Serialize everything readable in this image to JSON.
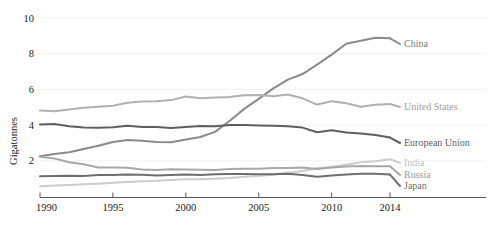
{
  "chart_data": {
    "type": "line",
    "title": "",
    "xlabel": "",
    "ylabel": "Gigatonnes",
    "xlim": [
      1990,
      2014
    ],
    "ylim": [
      0,
      10.6
    ],
    "grid": true,
    "legend_position": "right-inline",
    "xticks": [
      "1990",
      "1995",
      "2000",
      "2005",
      "2010",
      "2014"
    ],
    "xtick_values": [
      1990,
      1995,
      2000,
      2005,
      2010,
      2014
    ],
    "yticks": [
      "2",
      "4",
      "6",
      "8",
      "10"
    ],
    "ytick_values": [
      2,
      4,
      6,
      8,
      10
    ],
    "x": [
      1990,
      1991,
      1992,
      1993,
      1994,
      1995,
      1996,
      1997,
      1998,
      1999,
      2000,
      2001,
      2002,
      2003,
      2004,
      2005,
      2006,
      2007,
      2008,
      2009,
      2010,
      2011,
      2012,
      2013,
      2014
    ],
    "series": [
      {
        "name": "China",
        "label": "China",
        "color": "#8a8a8a",
        "label_color": "#7a7a7a",
        "values": [
          2.25,
          2.38,
          2.48,
          2.66,
          2.84,
          3.05,
          3.16,
          3.12,
          3.06,
          3.04,
          3.19,
          3.33,
          3.62,
          4.23,
          4.91,
          5.47,
          6.06,
          6.55,
          6.86,
          7.39,
          7.95,
          8.56,
          8.72,
          8.89,
          8.86
        ]
      },
      {
        "name": "United States",
        "label": "United States",
        "color": "#b0b0b0",
        "label_color": "#a0a0a0",
        "values": [
          4.82,
          4.77,
          4.87,
          4.97,
          5.03,
          5.08,
          5.25,
          5.32,
          5.34,
          5.4,
          5.6,
          5.51,
          5.54,
          5.58,
          5.67,
          5.69,
          5.61,
          5.71,
          5.5,
          5.15,
          5.34,
          5.22,
          5.03,
          5.14,
          5.18
        ]
      },
      {
        "name": "European Union",
        "label": "European Union",
        "color": "#5f5f5f",
        "label_color": "#5f5f5f",
        "values": [
          4.03,
          4.06,
          3.94,
          3.87,
          3.85,
          3.88,
          3.96,
          3.89,
          3.89,
          3.84,
          3.89,
          3.95,
          3.94,
          4.0,
          4.0,
          3.98,
          3.97,
          3.93,
          3.86,
          3.6,
          3.71,
          3.58,
          3.53,
          3.44,
          3.3
        ]
      },
      {
        "name": "India",
        "label": "India",
        "color": "#cccccc",
        "label_color": "#c0c0c0",
        "values": [
          0.58,
          0.62,
          0.65,
          0.68,
          0.72,
          0.77,
          0.81,
          0.85,
          0.88,
          0.93,
          0.96,
          0.97,
          1.0,
          1.03,
          1.1,
          1.15,
          1.23,
          1.33,
          1.43,
          1.58,
          1.67,
          1.78,
          1.92,
          1.98,
          2.09
        ]
      },
      {
        "name": "Russia",
        "label": "Russia",
        "color": "#a8a8a8",
        "label_color": "#9a9a9a",
        "values": [
          2.22,
          2.13,
          1.92,
          1.81,
          1.63,
          1.62,
          1.61,
          1.51,
          1.49,
          1.52,
          1.51,
          1.5,
          1.49,
          1.54,
          1.55,
          1.55,
          1.6,
          1.6,
          1.63,
          1.54,
          1.63,
          1.68,
          1.71,
          1.69,
          1.7
        ]
      },
      {
        "name": "Japan",
        "label": "Japan",
        "color": "#6e6e6e",
        "label_color": "#6e6e6e",
        "values": [
          1.14,
          1.15,
          1.16,
          1.15,
          1.2,
          1.21,
          1.23,
          1.22,
          1.18,
          1.21,
          1.23,
          1.21,
          1.25,
          1.26,
          1.26,
          1.25,
          1.24,
          1.27,
          1.21,
          1.11,
          1.17,
          1.23,
          1.27,
          1.28,
          1.23
        ]
      }
    ]
  }
}
